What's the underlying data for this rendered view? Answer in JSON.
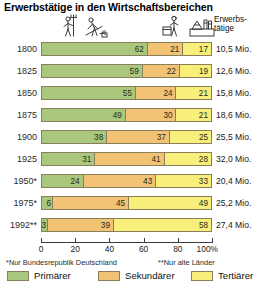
{
  "title": "Erwerbstätige in den Wirtschaftsbereichen",
  "header": {
    "right_label_line1": "Erwerbs-",
    "right_label_line2": "tätige",
    "icons": [
      {
        "name": "farmer-with-pitchfork-icon"
      },
      {
        "name": "farmer-harvesting-icon"
      },
      {
        "name": "industry-worker-icon"
      },
      {
        "name": "factory-building-icon"
      }
    ]
  },
  "axis": {
    "ticks": [
      0,
      20,
      40,
      60,
      80,
      100
    ],
    "tick_labels": [
      "0",
      "20",
      "40",
      "60",
      "80",
      "100%"
    ],
    "min": 0,
    "max": 100
  },
  "footnotes": {
    "a": "*Nur Bundesrepublik Deutschland",
    "b": "**Nur alte Länder"
  },
  "legend": {
    "items": [
      {
        "label": "Primärer",
        "color": "#a9c87e"
      },
      {
        "label": "Sekundärer",
        "color": "#f3c375"
      },
      {
        "label": "Tertiärer",
        "color": "#f7ef7a"
      }
    ]
  },
  "colors": {
    "primaer": "#a9c87e",
    "sekundaer": "#f3c375",
    "tertiaer": "#f7ef7a",
    "border": "#8a7f5a",
    "axis": "#3a3a3a",
    "background": "#ffffff"
  },
  "chart_data": {
    "type": "bar",
    "orientation": "horizontal",
    "stacked": true,
    "normalized_percent": true,
    "title": "Erwerbstätige in den Wirtschaftsbereichen",
    "xlabel": "",
    "ylabel": "",
    "xlim": [
      0,
      100
    ],
    "grid": false,
    "legend_position": "bottom",
    "categories": [
      "1800",
      "1825",
      "1850",
      "1875",
      "1900",
      "1925",
      "1950*",
      "1975*",
      "1992**"
    ],
    "series": [
      {
        "name": "Primärer",
        "color": "#a9c87e",
        "values": [
          62,
          59,
          55,
          49,
          38,
          31,
          24,
          6,
          3
        ]
      },
      {
        "name": "Sekundärer",
        "color": "#f3c375",
        "values": [
          21,
          22,
          24,
          30,
          37,
          41,
          43,
          45,
          39
        ]
      },
      {
        "name": "Tertiärer",
        "color": "#f7ef7a",
        "values": [
          17,
          19,
          21,
          21,
          25,
          28,
          33,
          49,
          58
        ]
      }
    ],
    "totals_label_suffix": "Mio.",
    "totals": [
      "10,5 Mio.",
      "12,6 Mio.",
      "15,8 Mio.",
      "18,6 Mio.",
      "25,5 Mio.",
      "32,0 Mio.",
      "20,4 Mio.",
      "25,2 Mio.",
      "27,4 Mio."
    ],
    "annotations": [
      "*Nur Bundesrepublik Deutschland",
      "**Nur alte Länder"
    ]
  },
  "rows": [
    {
      "year": "1800",
      "prim": 62,
      "sek": 21,
      "ter": 17,
      "total": "10,5 Mio."
    },
    {
      "year": "1825",
      "prim": 59,
      "sek": 22,
      "ter": 19,
      "total": "12,6 Mio."
    },
    {
      "year": "1850",
      "prim": 55,
      "sek": 24,
      "ter": 21,
      "total": "15,8 Mio."
    },
    {
      "year": "1875",
      "prim": 49,
      "sek": 30,
      "ter": 21,
      "total": "18,6 Mio."
    },
    {
      "year": "1900",
      "prim": 38,
      "sek": 37,
      "ter": 25,
      "total": "25,5 Mio."
    },
    {
      "year": "1925",
      "prim": 31,
      "sek": 41,
      "ter": 28,
      "total": "32,0 Mio."
    },
    {
      "year": "1950*",
      "prim": 24,
      "sek": 43,
      "ter": 33,
      "total": "20,4 Mio."
    },
    {
      "year": "1975*",
      "prim": 6,
      "sek": 45,
      "ter": 49,
      "total": "25,2 Mio."
    },
    {
      "year": "1992**",
      "prim": 3,
      "sek": 39,
      "ter": 58,
      "total": "27,4 Mio."
    }
  ]
}
